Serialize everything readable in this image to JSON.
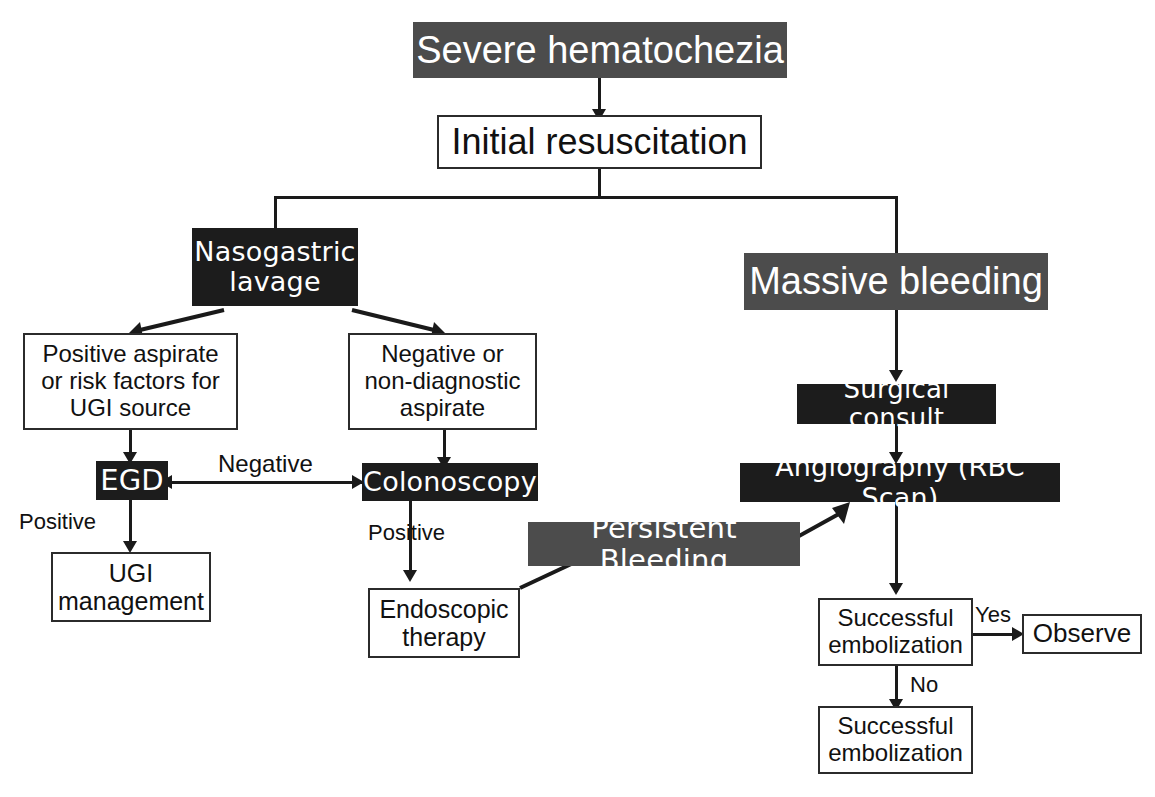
{
  "diagram": {
    "colors": {
      "grey_fill": "#4c4c4c",
      "black_fill": "#1c1c1c",
      "white_fill": "#ffffff",
      "line": "#1a1a1a",
      "dark_text": "#111111",
      "light_text": "#ffffff"
    },
    "nodes": {
      "severe_hematochezia": "Severe hematochezia",
      "initial_resuscitation": "Initial resuscitation",
      "nasogastric_lavage": "Nasogastric\nlavage",
      "massive_bleeding": "Massive bleeding",
      "positive_aspirate": "Positive aspirate\nor risk factors for\nUGI source",
      "negative_aspirate": "Negative or\nnon-diagnostic\naspirate",
      "surgical_consult": "Surgical consult",
      "egd": "EGD",
      "colonoscopy": "Colonoscopy",
      "angiography": "Angiography (RBC Scan)",
      "ugi_management": "UGI\nmanagement",
      "endoscopic_therapy": "Endoscopic\ntherapy",
      "persistent_bleeding": "Persistent Bleeding",
      "successful_embolization_1": "Successful\nembolization",
      "observe": "Observe",
      "successful_embolization_2": "Successful\nembolization"
    },
    "edge_labels": {
      "negative": "Negative",
      "positive_egd": "Positive",
      "positive_colonoscopy": "Positive",
      "yes": "Yes",
      "no": "No"
    }
  }
}
